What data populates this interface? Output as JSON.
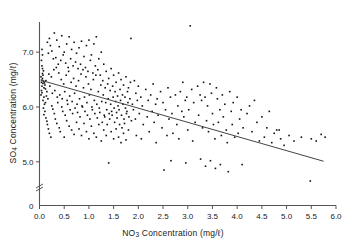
{
  "chart_data": {
    "type": "scatter",
    "title": "",
    "xlabel": "NO3 Concentration (mg/l)",
    "ylabel": "SO4 Concentration (mg/l)",
    "xlabel_parts": {
      "prefix": "NO",
      "sub": "3",
      "suffix": " Concentration (mg/ℓ)"
    },
    "ylabel_parts": {
      "prefix": "SO",
      "sub": "4",
      "suffix": " Concentration (mg/ℓ)"
    },
    "xlim": [
      0.0,
      6.0
    ],
    "ylim": [
      4.55,
      7.55
    ],
    "y_axis_break": true,
    "y_break_label": "0",
    "grid": false,
    "legend": null,
    "xticks": [
      0.0,
      0.5,
      1.0,
      1.5,
      2.0,
      2.5,
      3.0,
      3.5,
      4.0,
      4.5,
      5.0,
      5.5,
      6.0
    ],
    "xticklabels": [
      "0.0",
      "0.5",
      "1.0",
      "1.5",
      "2.0",
      "2.5",
      "3.0",
      "3.5",
      "4.0",
      "4.5",
      "5.0",
      "5.5",
      "6.0"
    ],
    "yticks": [
      5.0,
      6.0,
      7.0
    ],
    "yticklabels": [
      "5.0",
      "6.0",
      "7.0"
    ],
    "marker": "square",
    "marker_color": "#111111",
    "marker_size": 1.6,
    "line_color": "#444444",
    "axis_color": "#555555",
    "trendline": {
      "type": "linear-regression",
      "x_start": 0.02,
      "y_start": 6.49,
      "x_end": 5.75,
      "y_end": 5.01,
      "slope": -0.258,
      "intercept": 6.495
    },
    "points": [
      [
        0.04,
        6.45
      ],
      [
        0.05,
        6.49
      ],
      [
        0.06,
        6.52
      ],
      [
        0.07,
        6.43
      ],
      [
        0.05,
        6.38
      ],
      [
        0.08,
        6.47
      ],
      [
        0.03,
        6.55
      ],
      [
        0.06,
        6.61
      ],
      [
        0.09,
        6.35
      ],
      [
        0.04,
        6.3
      ],
      [
        0.07,
        6.58
      ],
      [
        0.05,
        6.26
      ],
      [
        0.1,
        6.44
      ],
      [
        0.08,
        6.66
      ],
      [
        0.03,
        6.22
      ],
      [
        0.06,
        6.7
      ],
      [
        0.11,
        6.4
      ],
      [
        0.09,
        6.18
      ],
      [
        0.05,
        6.75
      ],
      [
        0.12,
        6.33
      ],
      [
        0.07,
        6.12
      ],
      [
        0.04,
        6.85
      ],
      [
        0.13,
        6.48
      ],
      [
        0.1,
        6.05
      ],
      [
        0.06,
        6.95
      ],
      [
        0.15,
        6.28
      ],
      [
        0.08,
        5.98
      ],
      [
        0.05,
        7.05
      ],
      [
        0.14,
        6.2
      ],
      [
        0.11,
        5.92
      ],
      [
        0.16,
        7.18
      ],
      [
        0.12,
        6.08
      ],
      [
        0.09,
        5.86
      ],
      [
        0.18,
        6.98
      ],
      [
        0.17,
        6.15
      ],
      [
        0.13,
        5.8
      ],
      [
        0.2,
        7.25
      ],
      [
        0.19,
        6.6
      ],
      [
        0.15,
        5.74
      ],
      [
        0.22,
        7.12
      ],
      [
        0.21,
        6.38
      ],
      [
        0.16,
        5.68
      ],
      [
        0.25,
        7.02
      ],
      [
        0.24,
        6.55
      ],
      [
        0.18,
        5.6
      ],
      [
        0.28,
        6.88
      ],
      [
        0.26,
        6.25
      ],
      [
        0.2,
        5.52
      ],
      [
        0.3,
        7.35
      ],
      [
        0.29,
        6.68
      ],
      [
        0.23,
        5.45
      ],
      [
        0.33,
        6.9
      ],
      [
        0.31,
        6.3
      ],
      [
        0.25,
        6.02
      ],
      [
        0.35,
        7.22
      ],
      [
        0.34,
        6.72
      ],
      [
        0.27,
        5.96
      ],
      [
        0.38,
        6.78
      ],
      [
        0.36,
        6.18
      ],
      [
        0.3,
        5.88
      ],
      [
        0.4,
        7.1
      ],
      [
        0.39,
        6.62
      ],
      [
        0.32,
        5.78
      ],
      [
        0.43,
        6.85
      ],
      [
        0.41,
        6.22
      ],
      [
        0.35,
        5.7
      ],
      [
        0.45,
        7.3
      ],
      [
        0.44,
        6.5
      ],
      [
        0.37,
        6.08
      ],
      [
        0.48,
        6.95
      ],
      [
        0.46,
        6.15
      ],
      [
        0.4,
        5.62
      ],
      [
        0.5,
        7.0
      ],
      [
        0.49,
        6.42
      ],
      [
        0.42,
        5.55
      ],
      [
        0.53,
        6.8
      ],
      [
        0.51,
        6.28
      ],
      [
        0.45,
        6.0
      ],
      [
        0.55,
        7.15
      ],
      [
        0.54,
        6.58
      ],
      [
        0.47,
        5.92
      ],
      [
        0.58,
        6.72
      ],
      [
        0.56,
        6.12
      ],
      [
        0.5,
        5.45
      ],
      [
        0.6,
        7.28
      ],
      [
        0.59,
        6.65
      ],
      [
        0.52,
        5.85
      ],
      [
        0.63,
        6.88
      ],
      [
        0.61,
        6.2
      ],
      [
        0.55,
        5.75
      ],
      [
        0.65,
        7.05
      ],
      [
        0.64,
        6.45
      ],
      [
        0.57,
        6.05
      ],
      [
        0.68,
        6.75
      ],
      [
        0.66,
        6.1
      ],
      [
        0.6,
        5.65
      ],
      [
        0.7,
        7.18
      ],
      [
        0.69,
        6.52
      ],
      [
        0.62,
        5.95
      ],
      [
        0.73,
        6.82
      ],
      [
        0.71,
        6.25
      ],
      [
        0.65,
        5.58
      ],
      [
        0.75,
        6.98
      ],
      [
        0.74,
        6.38
      ],
      [
        0.67,
        5.88
      ],
      [
        0.78,
        6.7
      ],
      [
        0.76,
        6.05
      ],
      [
        0.7,
        5.5
      ],
      [
        0.8,
        7.08
      ],
      [
        0.79,
        6.48
      ],
      [
        0.72,
        5.98
      ],
      [
        0.83,
        6.78
      ],
      [
        0.81,
        6.15
      ],
      [
        0.75,
        5.72
      ],
      [
        0.85,
        7.2
      ],
      [
        0.84,
        6.6
      ],
      [
        0.77,
        5.9
      ],
      [
        0.88,
        6.68
      ],
      [
        0.86,
        6.02
      ],
      [
        0.8,
        5.6
      ],
      [
        0.9,
        6.92
      ],
      [
        0.89,
        6.35
      ],
      [
        0.82,
        5.82
      ],
      [
        0.93,
        6.72
      ],
      [
        0.91,
        6.18
      ],
      [
        0.85,
        5.48
      ],
      [
        0.95,
        7.12
      ],
      [
        0.94,
        6.55
      ],
      [
        0.87,
        6.0
      ],
      [
        0.98,
        6.65
      ],
      [
        0.96,
        6.08
      ],
      [
        0.9,
        5.7
      ],
      [
        1.0,
        7.22
      ],
      [
        0.99,
        6.42
      ],
      [
        0.92,
        5.92
      ],
      [
        1.03,
        6.85
      ],
      [
        1.01,
        6.22
      ],
      [
        0.95,
        5.55
      ],
      [
        1.05,
        6.95
      ],
      [
        1.04,
        6.32
      ],
      [
        0.97,
        5.85
      ],
      [
        1.08,
        6.62
      ],
      [
        1.06,
        6.0
      ],
      [
        1.0,
        5.42
      ],
      [
        1.1,
        7.15
      ],
      [
        1.09,
        6.5
      ],
      [
        1.02,
        5.78
      ],
      [
        1.13,
        6.75
      ],
      [
        1.11,
        6.12
      ],
      [
        1.05,
        5.65
      ],
      [
        1.15,
        7.28
      ],
      [
        1.14,
        6.58
      ],
      [
        1.07,
        5.95
      ],
      [
        1.18,
        6.68
      ],
      [
        1.16,
        6.05
      ],
      [
        1.1,
        5.52
      ],
      [
        1.2,
        6.88
      ],
      [
        1.19,
        6.28
      ],
      [
        1.12,
        5.88
      ],
      [
        1.23,
        6.58
      ],
      [
        1.21,
        5.98
      ],
      [
        1.15,
        5.45
      ],
      [
        1.25,
        7.0
      ],
      [
        1.24,
        6.4
      ],
      [
        1.17,
        5.8
      ],
      [
        1.28,
        6.48
      ],
      [
        1.26,
        6.1
      ],
      [
        1.2,
        5.68
      ],
      [
        1.3,
        6.78
      ],
      [
        1.29,
        6.22
      ],
      [
        1.22,
        5.9
      ],
      [
        1.33,
        6.35
      ],
      [
        1.31,
        5.85
      ],
      [
        1.25,
        5.38
      ],
      [
        1.35,
        6.65
      ],
      [
        1.34,
        6.08
      ],
      [
        1.27,
        5.72
      ],
      [
        1.38,
        6.42
      ],
      [
        1.36,
        5.95
      ],
      [
        1.3,
        5.58
      ],
      [
        1.4,
        6.52
      ],
      [
        1.39,
        6.15
      ],
      [
        1.32,
        5.82
      ],
      [
        1.43,
        6.3
      ],
      [
        1.41,
        5.88
      ],
      [
        1.35,
        5.48
      ],
      [
        1.45,
        6.7
      ],
      [
        1.44,
        6.05
      ],
      [
        1.37,
        5.68
      ],
      [
        1.48,
        6.38
      ],
      [
        1.46,
        5.92
      ],
      [
        1.4,
        4.98
      ],
      [
        1.5,
        6.58
      ],
      [
        1.49,
        6.18
      ],
      [
        1.42,
        5.78
      ],
      [
        1.53,
        6.28
      ],
      [
        1.51,
        5.98
      ],
      [
        1.45,
        5.55
      ],
      [
        1.55,
        6.45
      ],
      [
        1.54,
        6.1
      ],
      [
        1.47,
        5.85
      ],
      [
        1.58,
        6.2
      ],
      [
        1.56,
        5.9
      ],
      [
        1.5,
        5.42
      ],
      [
        1.6,
        6.62
      ],
      [
        1.59,
        6.02
      ],
      [
        1.52,
        5.72
      ],
      [
        1.63,
        6.32
      ],
      [
        1.61,
        5.95
      ],
      [
        1.55,
        5.6
      ],
      [
        1.65,
        6.5
      ],
      [
        1.64,
        6.12
      ],
      [
        1.57,
        5.8
      ],
      [
        1.68,
        6.22
      ],
      [
        1.66,
        5.85
      ],
      [
        1.6,
        5.45
      ],
      [
        1.7,
        6.4
      ],
      [
        1.69,
        6.05
      ],
      [
        1.62,
        5.68
      ],
      [
        1.73,
        6.18
      ],
      [
        1.71,
        5.78
      ],
      [
        1.65,
        5.35
      ],
      [
        1.75,
        6.55
      ],
      [
        1.74,
        5.98
      ],
      [
        1.67,
        5.62
      ],
      [
        1.78,
        6.28
      ],
      [
        1.76,
        5.88
      ],
      [
        1.7,
        5.52
      ],
      [
        1.8,
        6.35
      ],
      [
        1.79,
        6.08
      ],
      [
        1.72,
        5.7
      ],
      [
        1.83,
        6.15
      ],
      [
        1.81,
        5.82
      ],
      [
        1.75,
        5.4
      ],
      [
        1.85,
        7.25
      ],
      [
        1.84,
        6.45
      ],
      [
        1.77,
        5.92
      ],
      [
        1.88,
        6.05
      ],
      [
        1.86,
        5.75
      ],
      [
        1.8,
        5.58
      ],
      [
        1.92,
        6.48
      ],
      [
        1.95,
        6.25
      ],
      [
        1.9,
        5.95
      ],
      [
        1.98,
        6.12
      ],
      [
        1.94,
        5.78
      ],
      [
        1.96,
        5.48
      ],
      [
        2.0,
        6.38
      ],
      [
        2.05,
        6.18
      ],
      [
        2.02,
        5.88
      ],
      [
        2.08,
        6.02
      ],
      [
        2.1,
        5.68
      ],
      [
        2.06,
        5.42
      ],
      [
        2.15,
        6.32
      ],
      [
        2.2,
        6.12
      ],
      [
        2.18,
        5.82
      ],
      [
        2.25,
        6.22
      ],
      [
        2.28,
        5.92
      ],
      [
        2.22,
        5.55
      ],
      [
        2.3,
        6.42
      ],
      [
        2.35,
        6.05
      ],
      [
        2.32,
        5.72
      ],
      [
        2.38,
        6.15
      ],
      [
        2.4,
        5.85
      ],
      [
        2.36,
        5.35
      ],
      [
        2.45,
        6.28
      ],
      [
        2.5,
        6.08
      ],
      [
        2.48,
        5.62
      ],
      [
        2.55,
        5.95
      ],
      [
        2.58,
        5.48
      ],
      [
        2.52,
        4.85
      ],
      [
        2.6,
        6.35
      ],
      [
        2.65,
        6.18
      ],
      [
        2.62,
        5.78
      ],
      [
        2.68,
        5.88
      ],
      [
        2.7,
        5.52
      ],
      [
        2.66,
        5.02
      ],
      [
        2.75,
        6.22
      ],
      [
        2.8,
        6.02
      ],
      [
        2.78,
        5.68
      ],
      [
        2.85,
        6.28
      ],
      [
        2.88,
        5.92
      ],
      [
        2.82,
        5.42
      ],
      [
        2.9,
        6.45
      ],
      [
        2.95,
        6.12
      ],
      [
        2.92,
        5.82
      ],
      [
        2.98,
        6.18
      ],
      [
        3.0,
        5.58
      ],
      [
        2.96,
        4.98
      ],
      [
        3.05,
        7.48
      ],
      [
        3.08,
        6.32
      ],
      [
        3.02,
        5.95
      ],
      [
        3.12,
        6.08
      ],
      [
        3.15,
        5.72
      ],
      [
        3.1,
        5.38
      ],
      [
        3.2,
        6.38
      ],
      [
        3.25,
        6.22
      ],
      [
        3.22,
        5.85
      ],
      [
        3.28,
        6.12
      ],
      [
        3.3,
        5.62
      ],
      [
        3.26,
        5.05
      ],
      [
        3.32,
        6.45
      ],
      [
        3.35,
        6.18
      ],
      [
        3.38,
        5.75
      ],
      [
        3.4,
        6.02
      ],
      [
        3.42,
        5.55
      ],
      [
        3.36,
        4.92
      ],
      [
        3.45,
        6.42
      ],
      [
        3.48,
        6.25
      ],
      [
        3.5,
        5.88
      ],
      [
        3.52,
        5.68
      ],
      [
        3.55,
        5.42
      ],
      [
        3.46,
        5.02
      ],
      [
        3.58,
        6.35
      ],
      [
        3.6,
        6.15
      ],
      [
        3.62,
        5.72
      ],
      [
        3.65,
        5.95
      ],
      [
        3.68,
        5.48
      ],
      [
        3.56,
        4.88
      ],
      [
        3.7,
        6.22
      ],
      [
        3.72,
        5.82
      ],
      [
        3.75,
        6.05
      ],
      [
        3.78,
        5.58
      ],
      [
        3.8,
        5.35
      ],
      [
        3.66,
        4.95
      ],
      [
        3.85,
        6.28
      ],
      [
        3.88,
        5.92
      ],
      [
        3.9,
        5.68
      ],
      [
        3.92,
        6.08
      ],
      [
        3.95,
        5.45
      ],
      [
        3.82,
        4.82
      ],
      [
        4.0,
        6.18
      ],
      [
        4.05,
        5.78
      ],
      [
        4.02,
        5.52
      ],
      [
        4.08,
        5.95
      ],
      [
        4.1,
        4.95
      ],
      [
        4.12,
        5.62
      ],
      [
        4.2,
        5.88
      ],
      [
        4.25,
        6.02
      ],
      [
        4.3,
        5.55
      ],
      [
        4.35,
        6.12
      ],
      [
        4.4,
        5.72
      ],
      [
        4.45,
        5.38
      ],
      [
        4.5,
        5.82
      ],
      [
        4.55,
        5.45
      ],
      [
        4.6,
        5.62
      ],
      [
        4.65,
        5.92
      ],
      [
        4.7,
        5.35
      ],
      [
        4.75,
        5.52
      ],
      [
        4.8,
        5.58
      ],
      [
        4.85,
        5.58
      ],
      [
        4.88,
        5.42
      ],
      [
        4.95,
        5.3
      ],
      [
        5.05,
        5.48
      ],
      [
        5.15,
        5.38
      ],
      [
        5.3,
        5.45
      ],
      [
        5.48,
        4.65
      ],
      [
        5.5,
        5.42
      ],
      [
        5.78,
        5.45
      ],
      [
        5.6,
        5.38
      ],
      [
        5.7,
        5.5
      ]
    ]
  }
}
